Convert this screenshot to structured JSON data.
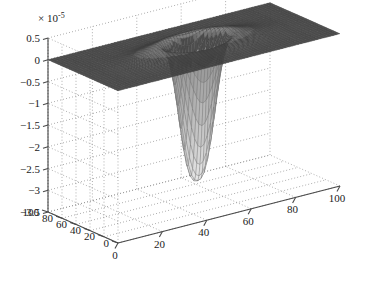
{
  "figure": {
    "background_color": "#ffffff",
    "surface_color": "#4d4d4d",
    "mesh_line_color": "#3c3c3c",
    "grid_color": "#8c8c8c",
    "axis_color": "#4a4a4a",
    "text_color": "#1a1a1a"
  },
  "chart_data": {
    "type": "surface",
    "title": "",
    "xlabel": "",
    "ylabel": "",
    "zlabel": "",
    "z_exponent_label": "× 10",
    "z_exponent_value": "-5",
    "z_scale_factor": 1e-05,
    "grid": true,
    "legend": null,
    "projection": "3d-mesh",
    "view_azimuth": -37.5,
    "view_elevation": 30,
    "xlim": [
      0,
      100
    ],
    "ylim": [
      0,
      100
    ],
    "zlim": [
      -3.5,
      0.5
    ],
    "xticks": [
      0,
      20,
      40,
      60,
      80,
      100
    ],
    "yticks": [
      0,
      20,
      40,
      60,
      80,
      100
    ],
    "zticks": [
      0.5,
      0,
      -0.5,
      -1,
      -1.5,
      -2,
      -2.5,
      -3,
      -3.5
    ],
    "xtick_labels": [
      "0",
      "20",
      "40",
      "60",
      "80",
      "100"
    ],
    "ytick_labels": [
      "0",
      "20",
      "40",
      "60",
      "80",
      "100"
    ],
    "ztick_labels": [
      "0.5",
      "0",
      "−0.5",
      "−1",
      "−1.5",
      "−2",
      "−2.5",
      "−3",
      "−3.5"
    ],
    "mesh_resolution": {
      "nx": 70,
      "ny": 70
    },
    "features": [
      {
        "name": "baseline-plane",
        "description": "flat plane at z = 0 covering the full x-y domain",
        "z_value": 0.0
      },
      {
        "name": "central-dome",
        "description": "raised elliptical bump near the domain center",
        "center_x": 50,
        "center_y": 50,
        "peak_z": 0.42,
        "radius_x": 26,
        "radius_y": 22
      },
      {
        "name": "deep-well",
        "description": "narrow funnel plunging far below the plane",
        "center_x": 50,
        "center_y": 46,
        "min_z": -3.45,
        "radius": 7.5
      }
    ]
  }
}
